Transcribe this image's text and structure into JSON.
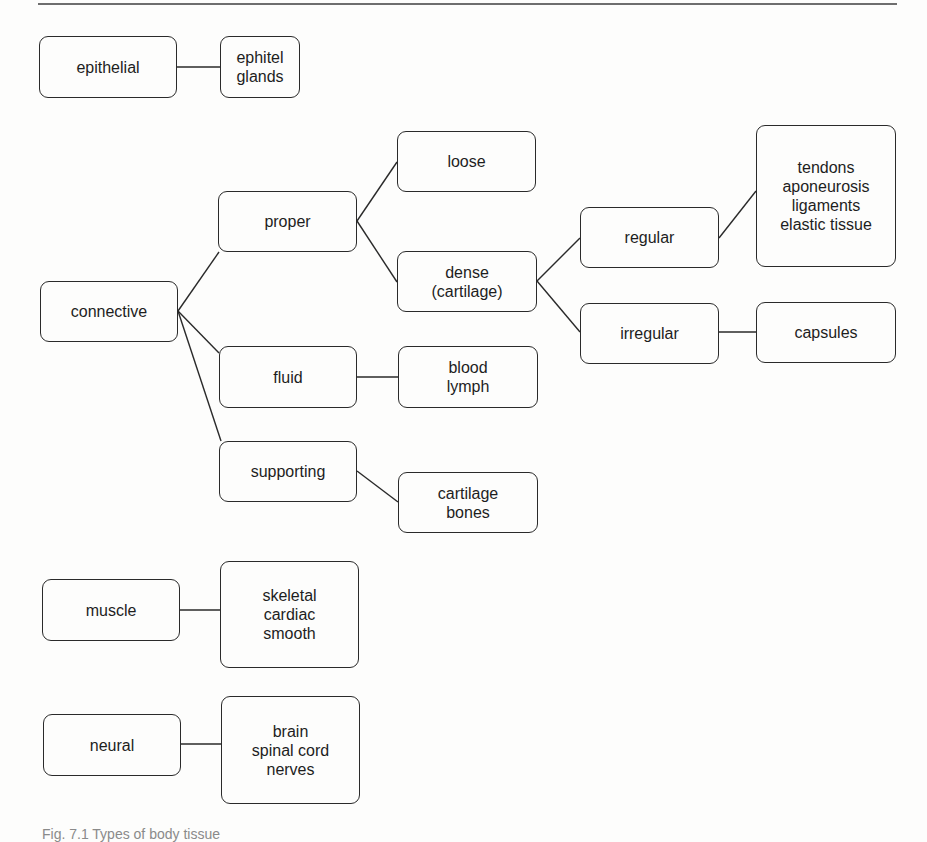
{
  "diagram": {
    "title": "Types of body tissue",
    "nodes": {
      "epithelial": {
        "lines": [
          "epithelial"
        ]
      },
      "epithel_glands": {
        "lines": [
          "ephitel",
          "glands"
        ]
      },
      "connective": {
        "lines": [
          "connective"
        ]
      },
      "proper": {
        "lines": [
          "proper"
        ]
      },
      "loose": {
        "lines": [
          "loose"
        ]
      },
      "dense": {
        "lines": [
          "dense",
          "(cartilage)"
        ]
      },
      "regular": {
        "lines": [
          "regular"
        ]
      },
      "regular_examples": {
        "lines": [
          "tendons",
          "aponeurosis",
          "ligaments",
          "elastic tissue"
        ]
      },
      "irregular": {
        "lines": [
          "irregular"
        ]
      },
      "capsules": {
        "lines": [
          "capsules"
        ]
      },
      "fluid": {
        "lines": [
          "fluid"
        ]
      },
      "fluid_examples": {
        "lines": [
          "blood",
          "lymph"
        ]
      },
      "supporting": {
        "lines": [
          "supporting"
        ]
      },
      "supporting_examples": {
        "lines": [
          "cartilage",
          "bones"
        ]
      },
      "muscle": {
        "lines": [
          "muscle"
        ]
      },
      "muscle_examples": {
        "lines": [
          "skeletal",
          "cardiac",
          "smooth"
        ]
      },
      "neural": {
        "lines": [
          "neural"
        ]
      },
      "neural_examples": {
        "lines": [
          "brain",
          "spinal cord",
          "nerves"
        ]
      }
    },
    "edges": [
      [
        "epithelial",
        "epithel_glands"
      ],
      [
        "connective",
        "proper"
      ],
      [
        "connective",
        "fluid"
      ],
      [
        "connective",
        "supporting"
      ],
      [
        "proper",
        "loose"
      ],
      [
        "proper",
        "dense"
      ],
      [
        "dense",
        "regular"
      ],
      [
        "dense",
        "irregular"
      ],
      [
        "regular",
        "regular_examples"
      ],
      [
        "irregular",
        "capsules"
      ],
      [
        "fluid",
        "fluid_examples"
      ],
      [
        "supporting",
        "supporting_examples"
      ],
      [
        "muscle",
        "muscle_examples"
      ],
      [
        "neural",
        "neural_examples"
      ]
    ]
  },
  "caption": {
    "text": "Fig. 7.1  Types of body tissue"
  },
  "colors": {
    "stroke": "#2a2a2a",
    "text": "#1e1e1e",
    "background": "#fdfdfc",
    "rule": "#6e6e6e"
  }
}
